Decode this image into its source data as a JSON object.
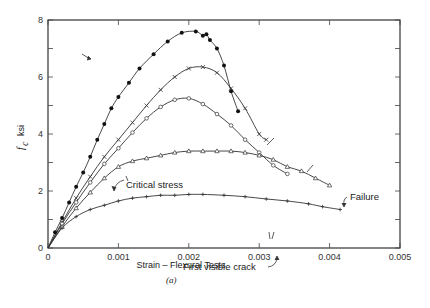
{
  "chart_data": {
    "type": "line",
    "title": "",
    "caption": "(a)",
    "xlabel": "Strain – Flexural Tests",
    "ylabel": "f_c ksi",
    "ylabel_main": "f",
    "ylabel_sub": "c",
    "ylabel_unit": "ksi",
    "xlim": [
      0,
      0.005
    ],
    "ylim": [
      0,
      8
    ],
    "x_ticks": [
      "0",
      "0.001",
      "0.002",
      "0.003",
      "0.004",
      "0.005"
    ],
    "y_ticks": [
      "0",
      "2",
      "4",
      "6",
      "8"
    ],
    "grid": false,
    "legend": "none",
    "series": [
      {
        "name": "Series 1 (filled circles)",
        "marker": "filled-circle",
        "x": [
          0,
          0.0001,
          0.0002,
          0.0003,
          0.0004,
          0.0005,
          0.0006,
          0.0007,
          0.0008,
          0.0009,
          0.001,
          0.00115,
          0.0013,
          0.0015,
          0.0017,
          0.0019,
          0.0021,
          0.0022,
          0.00225,
          0.0023,
          0.0024,
          0.0025,
          0.0026,
          0.0027
        ],
        "y": [
          0,
          0.55,
          1.05,
          1.6,
          2.15,
          2.65,
          3.2,
          3.8,
          4.35,
          4.9,
          5.3,
          5.8,
          6.3,
          6.8,
          7.25,
          7.55,
          7.6,
          7.45,
          7.5,
          7.3,
          7.0,
          6.4,
          5.5,
          4.8
        ]
      },
      {
        "name": "Series 2 (crosses)",
        "marker": "x",
        "x": [
          0,
          0.0002,
          0.0004,
          0.0006,
          0.0008,
          0.001,
          0.0012,
          0.0014,
          0.0016,
          0.0018,
          0.002,
          0.0022,
          0.0024,
          0.0026,
          0.0028,
          0.003,
          0.0031
        ],
        "y": [
          0,
          0.9,
          1.75,
          2.5,
          3.2,
          3.8,
          4.4,
          5.0,
          5.55,
          6.0,
          6.3,
          6.35,
          6.15,
          5.6,
          4.9,
          4.0,
          3.8
        ]
      },
      {
        "name": "Series 3 (open circles)",
        "marker": "open-circle",
        "x": [
          0,
          0.0002,
          0.0004,
          0.0006,
          0.0008,
          0.001,
          0.0012,
          0.0014,
          0.0016,
          0.0018,
          0.002,
          0.0022,
          0.0024,
          0.0026,
          0.0028,
          0.003,
          0.0032,
          0.0034
        ],
        "y": [
          0,
          0.85,
          1.6,
          2.3,
          2.95,
          3.5,
          4.05,
          4.55,
          4.95,
          5.2,
          5.25,
          5.05,
          4.7,
          4.3,
          3.8,
          3.35,
          2.9,
          2.6
        ]
      },
      {
        "name": "Series 4 (triangles)",
        "marker": "triangle",
        "x": [
          0,
          0.0002,
          0.0004,
          0.0006,
          0.0008,
          0.001,
          0.0012,
          0.0014,
          0.0016,
          0.0018,
          0.002,
          0.0022,
          0.0024,
          0.0026,
          0.0028,
          0.003,
          0.0032,
          0.0034,
          0.0036,
          0.0038,
          0.004
        ],
        "y": [
          0,
          0.75,
          1.4,
          1.95,
          2.45,
          2.85,
          3.05,
          3.15,
          3.25,
          3.35,
          3.4,
          3.4,
          3.4,
          3.4,
          3.35,
          3.25,
          3.1,
          2.85,
          2.7,
          2.45,
          2.2
        ]
      },
      {
        "name": "Series 5 (plus)",
        "marker": "plus",
        "x": [
          0,
          0.0002,
          0.0004,
          0.0006,
          0.0008,
          0.001,
          0.0012,
          0.0014,
          0.0016,
          0.0018,
          0.002,
          0.0022,
          0.0025,
          0.0028,
          0.0031,
          0.0034,
          0.0037,
          0.0039,
          0.00415
        ],
        "y": [
          0,
          0.7,
          1.1,
          1.35,
          1.5,
          1.65,
          1.75,
          1.8,
          1.85,
          1.85,
          1.88,
          1.88,
          1.85,
          1.8,
          1.72,
          1.65,
          1.55,
          1.45,
          1.35
        ]
      }
    ],
    "annotations": [
      {
        "text": "Critical stress",
        "x": 0.00095,
        "y": 2.0
      },
      {
        "text": "First visible crack",
        "x": 0.00265,
        "y": 1.2
      },
      {
        "text": "Failure",
        "x": 0.00445,
        "y": 1.6
      }
    ]
  }
}
